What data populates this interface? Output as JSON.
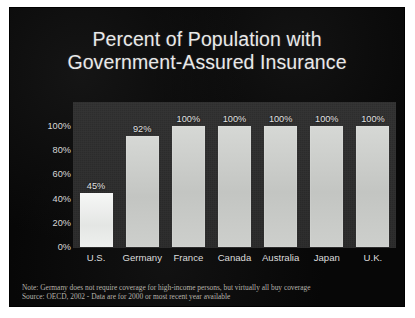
{
  "slide": {
    "title_line1": "Percent of Population with",
    "title_line2": "Government-Assured Insurance",
    "background_color": "#070707",
    "plot_background_color": "#2c2c2c",
    "bar_color": "#c9cbc8",
    "highlight_bar_color": "#eef0ee",
    "text_color": "#e9e9e9"
  },
  "footnotes": {
    "note": "Note: Germany does not require coverage for high-income persons, but virtually all buy coverage",
    "source": "Source: OECD, 2002 - Data are for 2000 or most recent year available"
  },
  "chart_data": {
    "type": "bar",
    "title": "Percent of Population with Government-Assured Insurance",
    "xlabel": "",
    "ylabel": "",
    "ylim": [
      0,
      100
    ],
    "grid": false,
    "legend": "none",
    "categories": [
      "U.S.",
      "Germany",
      "France",
      "Canada",
      "Australia",
      "Japan",
      "U.K."
    ],
    "values": [
      45,
      92,
      100,
      100,
      100,
      100,
      100
    ],
    "value_labels": [
      "45%",
      "92%",
      "100%",
      "100%",
      "100%",
      "100%",
      "100%"
    ],
    "highlight_index": 0,
    "ytick_values": [
      100,
      80,
      60,
      40,
      20,
      0
    ],
    "ytick_labels": [
      "100%",
      "80%",
      "60%",
      "40%",
      "20%",
      "0%"
    ]
  }
}
